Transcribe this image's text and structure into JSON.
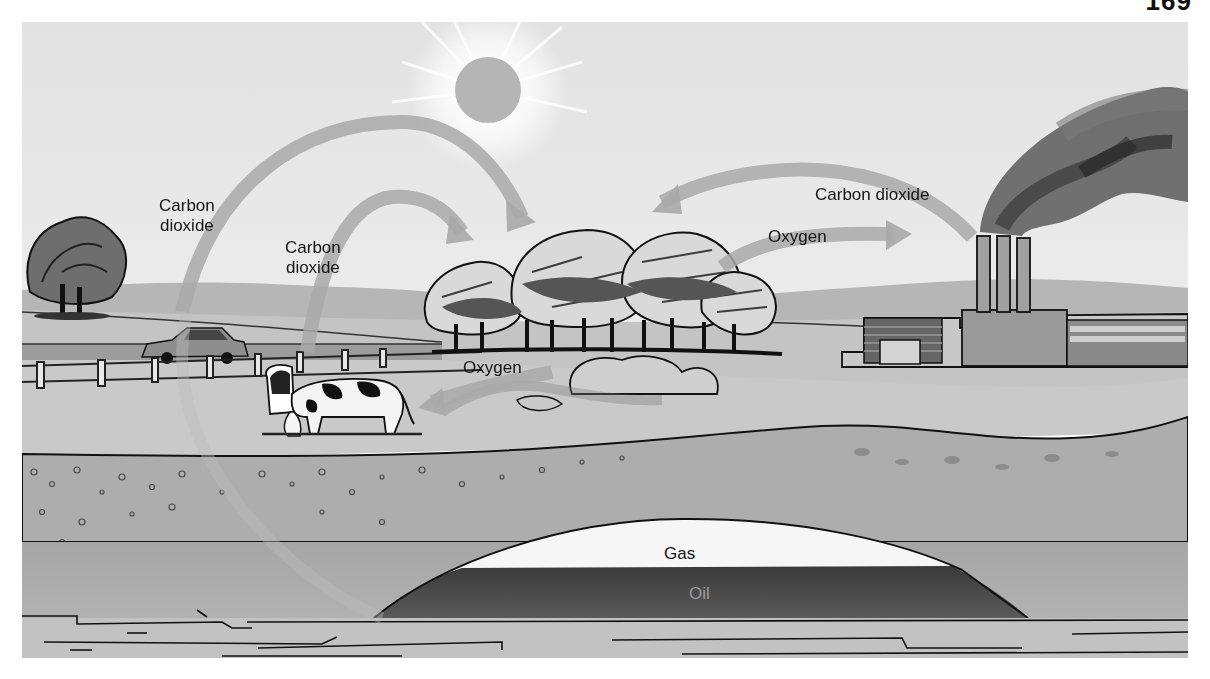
{
  "page": {
    "number": "169"
  },
  "diagram": {
    "labels": {
      "co2_car_line1": "Carbon",
      "co2_car_line2": "dioxide",
      "co2_cow_line1": "Carbon",
      "co2_cow_line2": "dioxide",
      "co2_factory": "Carbon dioxide",
      "oxygen_to_factory": "Oxygen",
      "oxygen_to_cow": "Oxygen",
      "gas": "Gas",
      "oil": "Oil"
    },
    "elements": [
      "sun",
      "trees",
      "car",
      "fence",
      "cows",
      "factory",
      "smokestacks",
      "smoke",
      "soil-layers",
      "gas-deposit",
      "oil-deposit",
      "bedrock"
    ],
    "arrows": [
      {
        "from": "car",
        "to": "trees",
        "label": "Carbon dioxide"
      },
      {
        "from": "cows",
        "to": "trees",
        "label": "Carbon dioxide"
      },
      {
        "from": "factory",
        "to": "trees",
        "label": "Carbon dioxide"
      },
      {
        "from": "trees",
        "to": "factory",
        "label": "Oxygen"
      },
      {
        "from": "trees",
        "to": "cows",
        "label": "Oxygen"
      }
    ],
    "colors": {
      "sky": "#e6e6e6",
      "hills": "#b4b4b4",
      "ground": "#c2c2c2",
      "soil": "#a9a9a9",
      "arrow": "#a8a8a8",
      "gas": "#f6f6f6",
      "oil": "#4a4a4a",
      "ink": "#141414"
    }
  }
}
